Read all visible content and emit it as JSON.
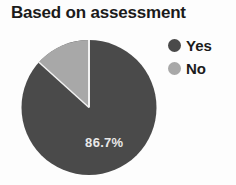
{
  "chart_data": {
    "type": "pie",
    "title": "Based on assessment",
    "categories": [
      "Yes",
      "No"
    ],
    "values": [
      86.7,
      13.3
    ],
    "value_labels": [
      "86.7%",
      ""
    ],
    "visible_data_label": "86.7%",
    "units": "percent",
    "colors": [
      "#4a4a4a",
      "#a8a8a8"
    ],
    "legend": {
      "position": "right",
      "entries": [
        {
          "label": "Yes",
          "color": "#4a4a4a",
          "marker": "circle"
        },
        {
          "label": "No",
          "color": "#a8a8a8",
          "marker": "circle"
        }
      ]
    },
    "start_angle_deg": 0,
    "direction": "clockwise",
    "grid": false,
    "xlabel": "",
    "ylabel": ""
  },
  "title": {
    "text": "Based on assessment"
  },
  "pie": {
    "slice_label": "86.7%",
    "slices": [
      {
        "name": "Yes",
        "percent": 86.7,
        "color": "#4a4a4a"
      },
      {
        "name": "No",
        "percent": 13.3,
        "color": "#a8a8a8"
      }
    ],
    "separator_color": "#f2f2f2"
  },
  "legend": {
    "items": [
      {
        "label": "Yes",
        "color": "#4a4a4a"
      },
      {
        "label": "No",
        "color": "#a8a8a8"
      }
    ]
  },
  "colors": {
    "background": "#fdfdfd",
    "text": "#1b1b1b",
    "slice_yes": "#4a4a4a",
    "slice_no": "#a8a8a8",
    "label_text": "#e8e8e8"
  }
}
